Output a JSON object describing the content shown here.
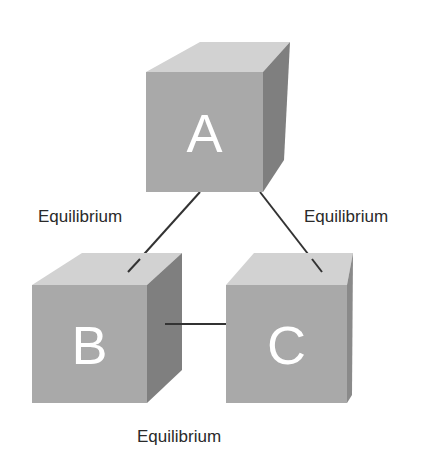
{
  "diagram": {
    "nodes": [
      {
        "id": "A",
        "label": "A"
      },
      {
        "id": "B",
        "label": "B"
      },
      {
        "id": "C",
        "label": "C"
      }
    ],
    "edges": [
      {
        "from": "A",
        "to": "B",
        "label": "Equilibrium"
      },
      {
        "from": "A",
        "to": "C",
        "label": "Equilibrium"
      },
      {
        "from": "B",
        "to": "C",
        "label": "Equilibrium"
      }
    ],
    "colors": {
      "front_face": "#a9a9a9",
      "top_face": "#d2d2d2",
      "side_face": "#7f7f7f",
      "letter": "#ffffff",
      "line": "#333333"
    }
  }
}
